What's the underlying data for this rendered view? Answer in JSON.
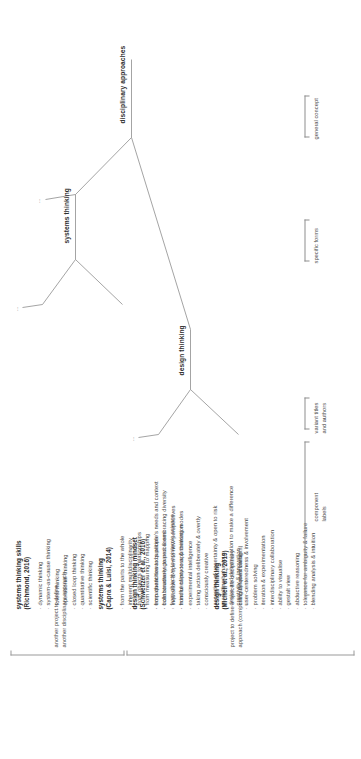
{
  "diagram": {
    "type": "tree",
    "orientation": "rotated-90-ccw",
    "root": {
      "label": "disciplinary approaches",
      "level_caption": "general concept"
    },
    "branches": [
      {
        "label": "design thinking",
        "level_caption": "specific forms",
        "variants": [
          {
            "title_line1": "design thinking",
            "title_line2": "(Micheli et al., 2019)",
            "components": [
              "creativity & innovation",
              "user-centeredness & involvement",
              "problem solving",
              "iteration & experimentation",
              "interdisciplinary collaboration",
              "ability to visualise",
              "gestalt view",
              "abductive reasoning",
              "tolerance for ambiguity & failure",
              "blending analysis & intuition"
            ]
          },
          {
            "title_line1": "design thinking mindset",
            "title_line2": "(Schweitzer et al., 2016)",
            "components": [
              "empathetic towards people's needs and context",
              "collaboratively geared & embracing diversity",
              "inquisitive & open to new perspectives",
              "mindful of process & thinking modes",
              "experimental intelligence",
              "taking action deliberately & overtly",
              "consciously creative",
              "accepting of uncertainty & open to risk",
              "modelling behaviour",
              "desire and determination to make a difference",
              "critically questioning"
            ]
          }
        ],
        "note": {
          "line1": "project to define a specific disciplinary",
          "line2": "approach (comprising different variants)"
        }
      },
      {
        "label": "systems thinking",
        "variants": [
          {
            "title_line1": "systems thinking",
            "title_line2": "(Capra & Luisi, 2014)",
            "components": [
              "from the parts to the whole",
              "inherent multidisciplinarity",
              "from objects to relationships",
              "from measuring to mapping",
              "from quantities to qualities",
              "from structures to processes",
              "from objective to epistemic science",
              "from certainty to approximation"
            ]
          },
          {
            "title_line1": "systems thinking skills",
            "title_line2": "(Richmond, 2016)",
            "components": [
              "dynamic thinking",
              "system-as-cause thinking",
              "forest thinking",
              "operational thinking",
              "closed loop thinking",
              "quantitative thinking",
              "scientific thinking"
            ]
          }
        ],
        "note": {
          "line1": "another project to define",
          "line2": "another disciplinary approach"
        }
      }
    ],
    "row_captions": {
      "general_concept": "general concept",
      "specific_forms": "specific forms",
      "variant_titles": "variant titles\nand authors",
      "variant_titles_line1": "variant titles",
      "variant_titles_line2": "and authors",
      "component_labels_line1": "component",
      "component_labels_line2": "labels"
    },
    "ellipses": {
      "top": "...",
      "mid": "...",
      "design": "...",
      "systems": "..."
    },
    "colors": {
      "line": "#8d8d8d",
      "text": "#3a3a3a",
      "heading": "#2e2e2e",
      "background": "#ffffff"
    }
  }
}
